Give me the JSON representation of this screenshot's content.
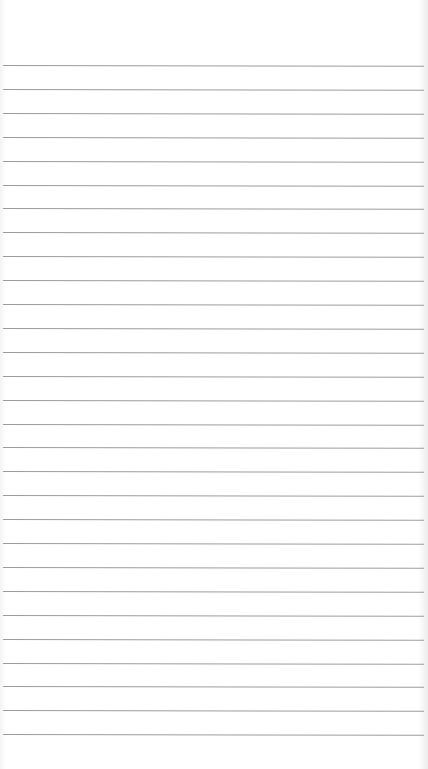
{
  "page": {
    "type": "lined-paper",
    "background_color": "#ffffff",
    "line_color": "#9c9c9c",
    "line_count": 29,
    "first_line_y": 65,
    "line_spacing": 23.9
  }
}
